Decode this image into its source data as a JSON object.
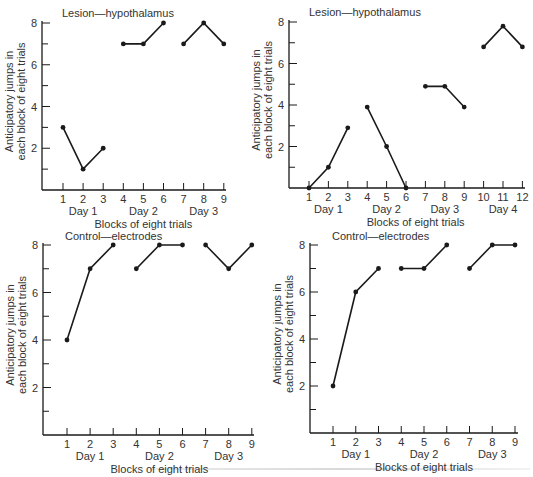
{
  "chart_data": [
    {
      "type": "line",
      "title": "Lesion—hypothalamus",
      "xlabel": "Blocks of eight trials",
      "ylabel": [
        "Anticipatory jumps in",
        "each block of eight trials"
      ],
      "ylim": [
        0,
        8
      ],
      "yticks": [
        2,
        4,
        6,
        8
      ],
      "yminor": [
        1,
        3,
        5,
        7
      ],
      "xticks": [
        1,
        2,
        3,
        4,
        5,
        6,
        7,
        8,
        9
      ],
      "day_labels": [
        {
          "label": "Day 1",
          "at": 2
        },
        {
          "label": "Day 2",
          "at": 5
        },
        {
          "label": "Day 3",
          "at": 8
        }
      ],
      "series": [
        {
          "name": "Day 1",
          "x": [
            1,
            2,
            3
          ],
          "values": [
            3,
            1,
            2
          ]
        },
        {
          "name": "Day 2",
          "x": [
            4,
            5,
            6
          ],
          "values": [
            7,
            7,
            8
          ]
        },
        {
          "name": "Day 3",
          "x": [
            7,
            8,
            9
          ],
          "values": [
            7,
            8,
            7
          ]
        }
      ],
      "grid": false,
      "layout": {
        "x_axis_left": 42,
        "y_zero": 190,
        "y_eight": 23,
        "x_first": 63,
        "x_step": 20.1,
        "x_axis_right": 226,
        "title_x": 62,
        "title_y": 17
      }
    },
    {
      "type": "line",
      "title": "Lesion—hypothalamus",
      "xlabel": "Blocks of eight trials",
      "ylabel": [
        "Anticipatory jumps in",
        "each block of eight trials"
      ],
      "ylim": [
        0,
        8
      ],
      "yticks": [
        2,
        4,
        6,
        8
      ],
      "yminor": [
        1,
        3,
        5,
        7
      ],
      "xticks": [
        1,
        2,
        3,
        4,
        5,
        6,
        7,
        8,
        9,
        10,
        11,
        12
      ],
      "day_labels": [
        {
          "label": "Day 1",
          "at": 2
        },
        {
          "label": "Day 2",
          "at": 5
        },
        {
          "label": "Day 3",
          "at": 8
        },
        {
          "label": "Day 4",
          "at": 11
        }
      ],
      "series": [
        {
          "name": "Day 1",
          "x": [
            1,
            2,
            3
          ],
          "values": [
            0,
            1,
            2.9
          ]
        },
        {
          "name": "Day 2",
          "x": [
            4,
            5,
            6
          ],
          "values": [
            3.9,
            2,
            0
          ]
        },
        {
          "name": "Day 3",
          "x": [
            7,
            8,
            9
          ],
          "values": [
            4.9,
            4.9,
            3.9
          ]
        },
        {
          "name": "Day 4",
          "x": [
            10,
            11,
            12
          ],
          "values": [
            6.8,
            7.8,
            6.8
          ]
        }
      ],
      "grid": false,
      "layout": {
        "x_axis_left": 289,
        "y_zero": 188,
        "y_eight": 22,
        "x_first": 309,
        "x_step": 19.4,
        "x_axis_right": 525,
        "title_x": 309,
        "title_y": 16
      }
    },
    {
      "type": "line",
      "title": "Control—electrodes",
      "xlabel": "Blocks of eight trials",
      "ylabel": [
        "Anticipatory jumps in",
        "each block of eight trials"
      ],
      "ylim": [
        0,
        8
      ],
      "yticks": [
        2,
        4,
        6,
        8
      ],
      "yminor": [
        1,
        3,
        5,
        7
      ],
      "xticks": [
        1,
        2,
        3,
        4,
        5,
        6,
        7,
        8,
        9
      ],
      "day_labels": [
        {
          "label": "Day 1",
          "at": 2
        },
        {
          "label": "Day 2",
          "at": 5
        },
        {
          "label": "Day 3",
          "at": 8
        }
      ],
      "series": [
        {
          "name": "Day 1",
          "x": [
            1,
            2,
            3
          ],
          "values": [
            4,
            7,
            8
          ]
        },
        {
          "name": "Day 2",
          "x": [
            4,
            5,
            6
          ],
          "values": [
            7,
            8,
            8
          ]
        },
        {
          "name": "Day 3",
          "x": [
            7,
            8,
            9
          ],
          "values": [
            8,
            7,
            8
          ]
        }
      ],
      "grid": false,
      "layout": {
        "x_axis_left": 43,
        "y_zero": 435,
        "y_eight": 245,
        "x_first": 67,
        "x_step": 23.1,
        "x_axis_right": 254,
        "title_x": 65,
        "title_y": 240
      }
    },
    {
      "type": "line",
      "title": "Control—electrodes",
      "xlabel": "Blocks of eight trials",
      "ylabel": [
        "Anticipatory jumps in",
        "each block of eight trials"
      ],
      "ylim": [
        0,
        8
      ],
      "yticks": [
        2,
        4,
        6,
        8
      ],
      "yminor": [
        1,
        3,
        5,
        7
      ],
      "xticks": [
        1,
        2,
        3,
        4,
        5,
        6,
        7,
        8,
        9
      ],
      "day_labels": [
        {
          "label": "Day 1",
          "at": 2
        },
        {
          "label": "Day 2",
          "at": 5
        },
        {
          "label": "Day 3",
          "at": 8
        }
      ],
      "series": [
        {
          "name": "Day 1",
          "x": [
            1,
            2,
            3
          ],
          "values": [
            2,
            6,
            7
          ]
        },
        {
          "name": "Day 2",
          "x": [
            4,
            5,
            6
          ],
          "values": [
            7,
            7,
            8
          ]
        },
        {
          "name": "Day 3",
          "x": [
            7,
            8,
            9
          ],
          "values": [
            7,
            8,
            8
          ]
        }
      ],
      "grid": false,
      "layout": {
        "x_axis_left": 310,
        "y_zero": 433,
        "y_eight": 245,
        "x_first": 333,
        "x_step": 22.75,
        "x_axis_right": 518,
        "title_x": 332,
        "title_y": 240
      }
    }
  ],
  "colors": {
    "ink": "#1a1a1a",
    "text": "#333333",
    "background": "#ffffff"
  }
}
